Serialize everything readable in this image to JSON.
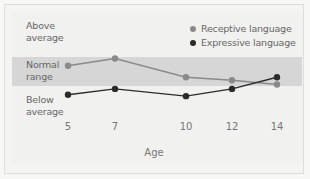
{
  "chart_data": {
    "type": "line",
    "title": "",
    "xlabel": "Age",
    "ylabel": "",
    "categories": [
      "5",
      "7",
      "10",
      "12",
      "14"
    ],
    "y_zones": [
      "Above average",
      "Normal range",
      "Below average"
    ],
    "series": [
      {
        "name": "Receptive language",
        "color": "#8a8a8a",
        "values": [
          0.7,
          0.95,
          0.3,
          0.2,
          0.05
        ],
        "zones": [
          "Normal range",
          "Normal range",
          "Below average",
          "Below average",
          "Below average"
        ]
      },
      {
        "name": "Expressive language",
        "color": "#2b2b2b",
        "values": [
          -0.3,
          -0.1,
          -0.35,
          -0.1,
          0.3
        ],
        "zones": [
          "Below average",
          "Below average",
          "Below average",
          "Below average",
          "Below average"
        ]
      }
    ],
    "value_scale_note": "0 = bottom of normal range, 1 = top of normal range",
    "normal_band": [
      0,
      1
    ],
    "grid": false,
    "legend_position": "top-right"
  },
  "labels": {
    "above_line1": "Above",
    "above_line2": "average",
    "normal_line1": "Normal",
    "normal_line2": "range",
    "below_line1": "Below",
    "below_line2": "average"
  },
  "legend": {
    "receptive": "Receptive language",
    "expressive": "Expressive language"
  },
  "colors": {
    "receptive": "#8a8a8a",
    "expressive": "#2b2b2b",
    "band": "#d6d6d6"
  }
}
